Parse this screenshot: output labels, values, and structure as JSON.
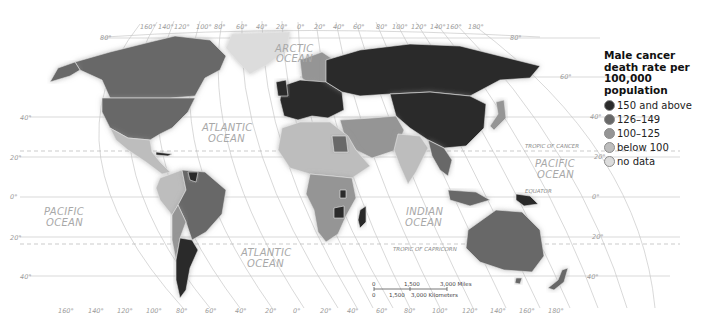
{
  "map": {
    "title": "Male cancer death rate per 100,000 population",
    "projection_grid": {
      "top_longitudes": [
        "160°",
        "140°",
        "120°",
        "100°",
        "80°",
        "60°",
        "40°",
        "20°",
        "0°",
        "20°",
        "40°",
        "60°",
        "80°",
        "100°",
        "120°",
        "140°",
        "160°",
        "180°"
      ],
      "bottom_longitudes": [
        "160°",
        "140°",
        "120°",
        "100°",
        "80°",
        "60°",
        "40°",
        "20°",
        "0°",
        "20°",
        "40°",
        "60°",
        "80°",
        "100°",
        "120°",
        "140°",
        "160°",
        "180°"
      ],
      "left_latitudes": [
        "80°",
        "40°",
        "20°",
        "0°",
        "20°",
        "40°"
      ],
      "right_latitudes": [
        "80°",
        "60°",
        "40°",
        "20°",
        "0°",
        "20°",
        "40°"
      ]
    },
    "oceans": {
      "arctic": [
        "ARCTIC",
        "OCEAN"
      ],
      "atlantic_north": [
        "ATLANTIC",
        "OCEAN"
      ],
      "atlantic_south": [
        "ATLANTIC",
        "OCEAN"
      ],
      "pacific_west": [
        "PACIFIC",
        "OCEAN"
      ],
      "pacific_east": [
        "PACIFIC",
        "OCEAN"
      ],
      "indian": [
        "INDIAN",
        "OCEAN"
      ]
    },
    "lines": {
      "tropic_cancer": "TROPIC OF CANCER",
      "tropic_capricorn": "TROPIC OF CAPRICORN",
      "equator": "EQUATOR"
    },
    "scale": {
      "miles": [
        "0",
        "1,500",
        "3,000 Miles"
      ],
      "km": [
        "0",
        "1,500",
        "3,000 Kilometers"
      ]
    }
  },
  "legend": {
    "title": "Male cancer death rate per 100,000 population",
    "items": [
      {
        "label": "150 and above",
        "color": "#2b2b2b"
      },
      {
        "label": "126–149",
        "color": "#686868"
      },
      {
        "label": "100–125",
        "color": "#959595"
      },
      {
        "label": "below 100",
        "color": "#bdbdbd"
      },
      {
        "label": "no data",
        "color": "#dcdcdc"
      }
    ]
  }
}
